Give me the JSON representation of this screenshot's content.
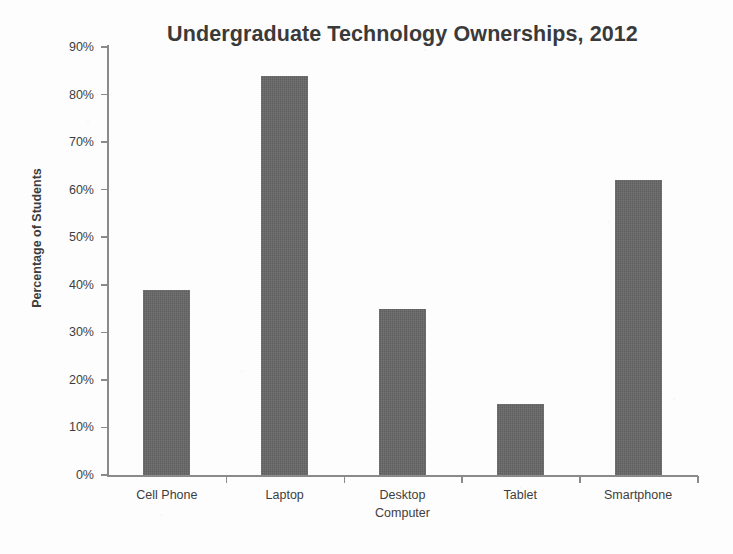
{
  "chart_data": {
    "type": "bar",
    "title": "Undergraduate Technology Ownerships, 2012",
    "xlabel": "",
    "ylabel": "Percentage of Students",
    "categories": [
      "Cell Phone",
      "Laptop",
      "Desktop Computer",
      "Tablet",
      "Smartphone"
    ],
    "category_lines": [
      [
        "Cell Phone"
      ],
      [
        "Laptop"
      ],
      [
        "Desktop",
        "Computer"
      ],
      [
        "Tablet"
      ],
      [
        "Smartphone"
      ]
    ],
    "values": [
      39,
      84,
      35,
      15,
      62
    ],
    "value_labels": [
      "39%",
      "84%",
      "35%",
      "15%",
      "62%"
    ],
    "ylim": [
      0,
      90
    ],
    "ytick_values": [
      0,
      10,
      20,
      30,
      40,
      50,
      60,
      70,
      80,
      90
    ],
    "ytick_labels": [
      "0%",
      "10%",
      "20%",
      "30%",
      "40%",
      "50%",
      "60%",
      "70%",
      "80%",
      "90%"
    ],
    "grid": false,
    "legend": false,
    "legend_position": "none",
    "bar_color": "#656565",
    "axis_color": "#8a8a8a",
    "text_color": "#3d3d3d",
    "title_color": "#3a3a3a",
    "background_color": "#fdfdfd"
  }
}
